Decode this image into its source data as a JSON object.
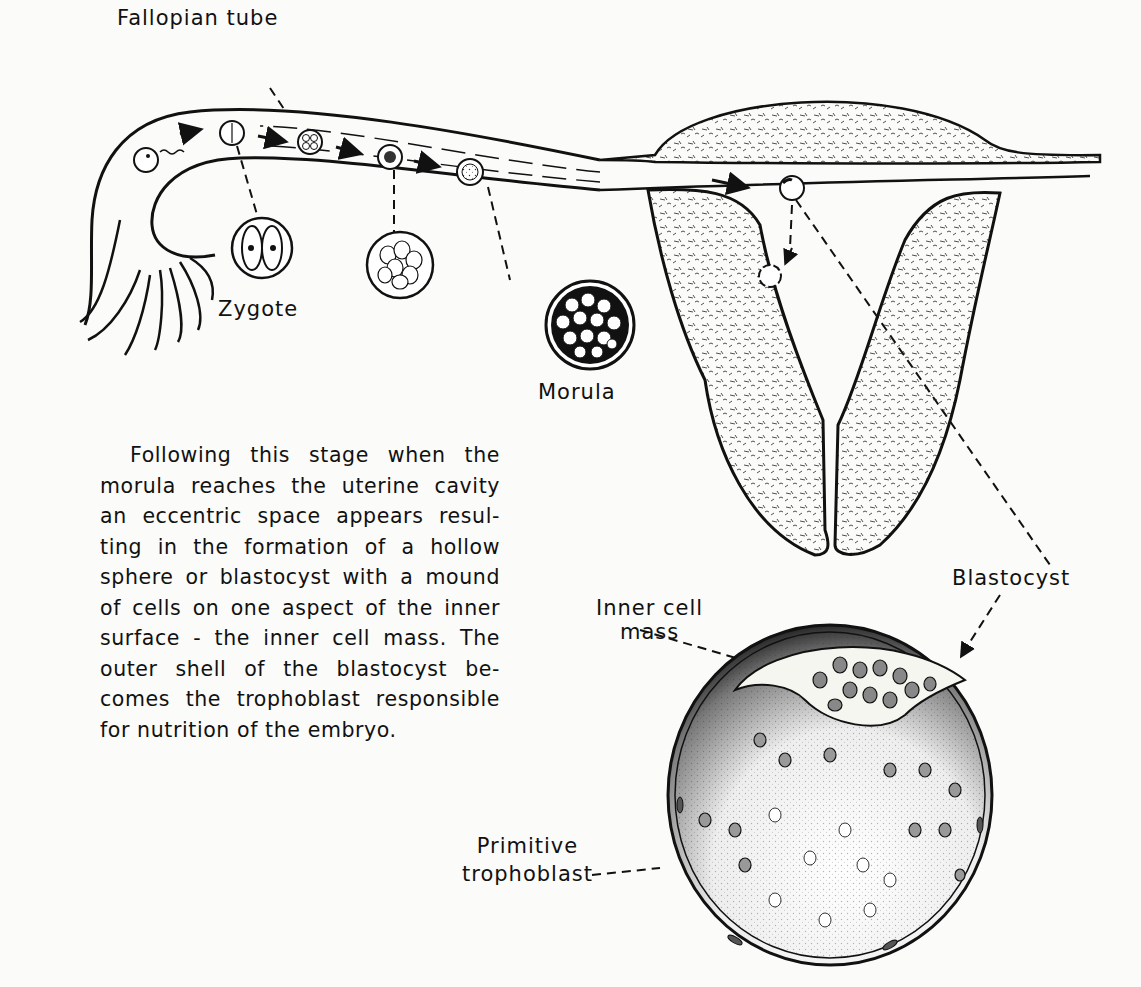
{
  "labels": {
    "fallopian_tube": "Fallopian tube",
    "zygote": "Zygote",
    "morula": "Morula",
    "blastocyst": "Blastocyst",
    "inner_cell_mass_line1": "Inner cell",
    "inner_cell_mass_line2": "mass",
    "primitive_trophoblast_line1": "Primitive",
    "primitive_trophoblast_line2": "trophoblast"
  },
  "paragraph": {
    "lines": [
      "Following this stage when the",
      "morula reaches the uterine cavity",
      "an eccentric space appears resul-",
      "ting in the formation of a hollow",
      "sphere or blastocyst with a mound",
      "of cells on one aspect of the inner",
      "surface - the inner cell mass. The",
      "outer shell of the blastocyst be-",
      "comes the trophoblast responsible",
      "for nutrition of the embryo."
    ]
  },
  "stages": [
    "Ovum",
    "Zygote",
    "Four-cell stage",
    "Eight-cell stage",
    "Morula",
    "Blastocyst",
    "Implantation site"
  ]
}
